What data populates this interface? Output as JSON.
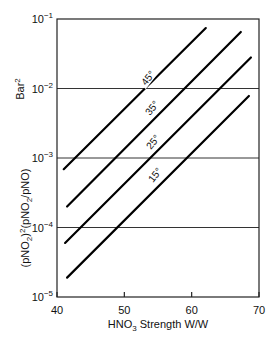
{
  "chart_data": {
    "type": "line",
    "title": "",
    "xlabel": "HNO3 Strength W/W",
    "xlabel_parts": {
      "pre": "HNO",
      "sub": "3",
      "post": " Strength W/W"
    },
    "ylabel": "(pNO2)^2(pNO2/pNO) Bar^2",
    "ylabel_unit": "Bar",
    "ylabel_unit_sup": "2",
    "y_scale": "log",
    "xlim": [
      40,
      70
    ],
    "ylim": [
      1e-05,
      0.1
    ],
    "x_ticks": [
      "40",
      "50",
      "60",
      "70"
    ],
    "x_tick_values": [
      40,
      50,
      60,
      70
    ],
    "y_ticks": [
      {
        "base": "10",
        "exp": "−5",
        "value": 1e-05
      },
      {
        "base": "10",
        "exp": "−4",
        "value": 0.0001
      },
      {
        "base": "10",
        "exp": "−3",
        "value": 0.001
      },
      {
        "base": "10",
        "exp": "−2",
        "value": 0.01
      },
      {
        "base": "10",
        "exp": "−1",
        "value": 0.1
      }
    ],
    "grid": {
      "horizontal_at": [
        0.0001,
        0.001,
        0.01
      ],
      "vertical": false
    },
    "legend": "inline labels on lines",
    "series": [
      {
        "name": "45°",
        "x": [
          41.0,
          62.1
        ],
        "y": [
          0.00069,
          0.074
        ]
      },
      {
        "name": "35°",
        "x": [
          41.5,
          67.3
        ],
        "y": [
          0.0002,
          0.065
        ]
      },
      {
        "name": "25°",
        "x": [
          41.2,
          68.8
        ],
        "y": [
          6e-05,
          0.028
        ]
      },
      {
        "name": "15°",
        "x": [
          41.5,
          68.5
        ],
        "y": [
          1.9e-05,
          0.0078
        ]
      }
    ]
  }
}
